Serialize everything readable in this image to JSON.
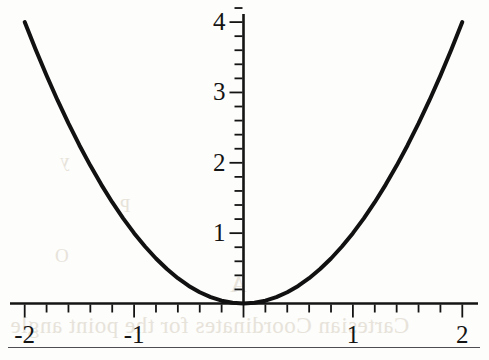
{
  "page": {
    "background_color": "#fdfdfb",
    "ink_color": "#141414",
    "rule_color": "#4e4e52"
  },
  "bleed_through_text": {
    "note": "faint mirrored show-through from reverse side of scanned page",
    "color": "#e7e3da",
    "lines": [
      "y",
      "P",
      "O",
      "Cartesian Coordinates for the point angle",
      "A"
    ]
  },
  "chart_data": {
    "type": "line",
    "title": "",
    "subtitle": "",
    "xlabel": "",
    "ylabel": "",
    "function": "y = x^2",
    "xlim": [
      -2.18,
      2.14
    ],
    "ylim": [
      -0.12,
      4.2
    ],
    "grid": false,
    "legend": null,
    "axes": {
      "x_axis": {
        "tick_labels": [
          "-2",
          "-1",
          "1",
          "2"
        ],
        "tick_values": [
          -2,
          -1,
          1,
          2
        ],
        "minor_tick_step": 0.2,
        "labels_below_axis": true,
        "zero_label_hidden": true
      },
      "y_axis": {
        "tick_labels": [
          "1",
          "2",
          "3",
          "4"
        ],
        "tick_values": [
          1,
          2,
          3,
          4
        ],
        "minor_tick_step": 0.2,
        "labels_left_of_axis": true,
        "zero_label_hidden": true
      }
    },
    "series": [
      {
        "name": "y = x^2",
        "color": "#111111",
        "line_width": 4,
        "x": [
          -2.0,
          -1.9,
          -1.8,
          -1.7,
          -1.6,
          -1.5,
          -1.4,
          -1.3,
          -1.2,
          -1.1,
          -1.0,
          -0.9,
          -0.8,
          -0.7,
          -0.6,
          -0.5,
          -0.4,
          -0.3,
          -0.2,
          -0.1,
          0.0,
          0.1,
          0.2,
          0.3,
          0.4,
          0.5,
          0.6,
          0.7,
          0.8,
          0.9,
          1.0,
          1.1,
          1.2,
          1.3,
          1.4,
          1.5,
          1.6,
          1.7,
          1.8,
          1.9,
          2.0
        ],
        "y": [
          4.0,
          3.61,
          3.24,
          2.89,
          2.56,
          2.25,
          1.96,
          1.69,
          1.44,
          1.21,
          1.0,
          0.81,
          0.64,
          0.49,
          0.36,
          0.25,
          0.16,
          0.09,
          0.04,
          0.01,
          0.0,
          0.01,
          0.04,
          0.09,
          0.16,
          0.25,
          0.36,
          0.49,
          0.64,
          0.81,
          1.0,
          1.21,
          1.44,
          1.69,
          1.96,
          2.25,
          2.56,
          2.89,
          3.24,
          3.61,
          4.0
        ]
      }
    ]
  },
  "footer_rule": {
    "visible": true
  }
}
